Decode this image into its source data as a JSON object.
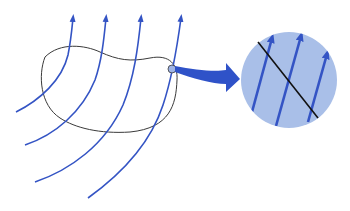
{
  "diagram": {
    "colors": {
      "background": "#ffffff",
      "field_line": "#3454c4",
      "surface_outline": "#3a3a3a",
      "magnifier_fill": "#a9bfe8",
      "magnifier_stroke": "#a9bfe8",
      "pointer_arrow": "#2f52c8",
      "tangent_line": "#111111",
      "marker_circle_fill": "#9fb4e6"
    },
    "field_lines": [
      {
        "id": "field-line-1",
        "path": "M16,112 C40,100 62,80 68,55 C71,40 72,28 73,18",
        "arrow_tip": [
          73,
          14
        ]
      },
      {
        "id": "field-line-2",
        "path": "M25,145 C55,135 82,112 95,80 C102,60 104,38 106,18",
        "arrow_tip": [
          106,
          14
        ]
      },
      {
        "id": "field-line-3",
        "path": "M35,182 C70,170 105,145 123,105 C134,78 138,48 141,18",
        "arrow_tip": [
          141,
          14
        ]
      },
      {
        "id": "field-line-4",
        "path": "M88,198 C120,175 150,145 163,105 C172,78 177,48 181,18",
        "arrow_tip": [
          181,
          14
        ]
      }
    ],
    "closed_surface": {
      "path": "M45,57 C60,42 85,45 100,52 C118,60 130,62 150,58 C170,54 178,65 177,80 C176,105 170,128 130,132 C100,134 75,128 60,118 C40,105 38,75 45,57 Z"
    },
    "marker": {
      "cx": 172,
      "cy": 69,
      "r": 4
    },
    "pointer_arrow": {
      "path": "M175,66 C195,70 215,72 226,70 L226,63 L240,79 L226,92 L226,84 C212,84 192,78 175,72 Z"
    },
    "magnifier": {
      "cx": 289,
      "cy": 80,
      "r": 48,
      "tangent_line": {
        "x1": 258,
        "y1": 42,
        "x2": 318,
        "y2": 118
      },
      "vectors": [
        {
          "x1": 252,
          "y1": 112,
          "x2": 272,
          "y2": 38
        },
        {
          "x1": 276,
          "y1": 126,
          "x2": 301,
          "y2": 36
        },
        {
          "x1": 308,
          "y1": 122,
          "x2": 327,
          "y2": 54
        }
      ]
    }
  }
}
